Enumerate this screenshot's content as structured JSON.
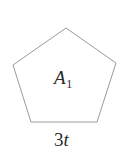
{
  "figure": {
    "type": "polygon",
    "shape_name": "regular-pentagon",
    "stroke_color": "#9a9a9a",
    "fill_color": "#ffffff",
    "stroke_width": 1,
    "background_color": "#ffffff",
    "width": 131,
    "height": 163,
    "vertices": [
      {
        "name": "apex",
        "x": 66,
        "y": 28
      },
      {
        "name": "right",
        "x": 116,
        "y": 63
      },
      {
        "name": "bottom-right",
        "x": 97,
        "y": 122
      },
      {
        "name": "bottom-left",
        "x": 31,
        "y": 122
      },
      {
        "name": "left",
        "x": 13,
        "y": 65
      }
    ],
    "points_attr": "66,28 116,63 97,122 31,122 13,65"
  },
  "labels": {
    "area": {
      "symbol": "A",
      "subscript": "1",
      "full_text": "A1",
      "color": "#2b2b2b"
    },
    "base": {
      "coefficient": "3",
      "variable": "t",
      "full_text": "3t",
      "color": "#2b2b2b"
    }
  }
}
